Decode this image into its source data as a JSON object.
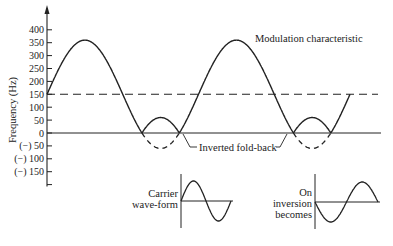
{
  "chart_data": {
    "type": "line",
    "title": "Modulation characteristic",
    "ylabel": "Frequency (Hz)",
    "xlabel": "",
    "ylim": [
      -175,
      420
    ],
    "yticks": [
      400,
      350,
      300,
      250,
      200,
      150,
      100,
      50,
      0,
      -50,
      -100,
      -150,
      -200
    ],
    "ytick_labels": [
      "400",
      "350",
      "300",
      "250",
      "200",
      "150",
      "100",
      "50",
      "0",
      "(−) 50",
      "(−) 100",
      "(−) 150",
      ""
    ],
    "reference_line": {
      "value": 150,
      "style": "dashed"
    },
    "modulation": {
      "center_hz": 150,
      "amplitude_hz": 210,
      "peak_hz": 360,
      "trough_hz": -60,
      "cycles_shown": 2
    },
    "series": [
      {
        "name": "Modulation characteristic",
        "style": "solid",
        "note": "negative portions folded back as positive"
      },
      {
        "name": "Inverted fold-back",
        "style": "dashed",
        "note": "negative excursion below zero"
      }
    ],
    "annotations": {
      "title": "Modulation characteristic",
      "fold_back": "Inverted fold-back"
    }
  },
  "insets": {
    "carrier": {
      "label_lines": [
        "Carrier",
        "wave-form"
      ]
    },
    "inverted": {
      "label_lines": [
        "On",
        "inversion",
        "becomes"
      ]
    }
  }
}
